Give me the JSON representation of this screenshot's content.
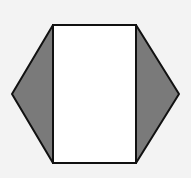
{
  "figure": {
    "colors": {
      "background": "#f3f3f3",
      "rectangle_fill": "#ffffff",
      "triangle_fill": "#7a7a7a",
      "stroke": "#111111"
    },
    "shapes": {
      "rectangle": {
        "x": 53,
        "y": 25,
        "width": 83,
        "height": 138
      },
      "left_triangle": [
        [
          53,
          25
        ],
        [
          12,
          94
        ],
        [
          53,
          163
        ]
      ],
      "right_triangle": [
        [
          136,
          25
        ],
        [
          179,
          94
        ],
        [
          136,
          163
        ]
      ]
    }
  }
}
